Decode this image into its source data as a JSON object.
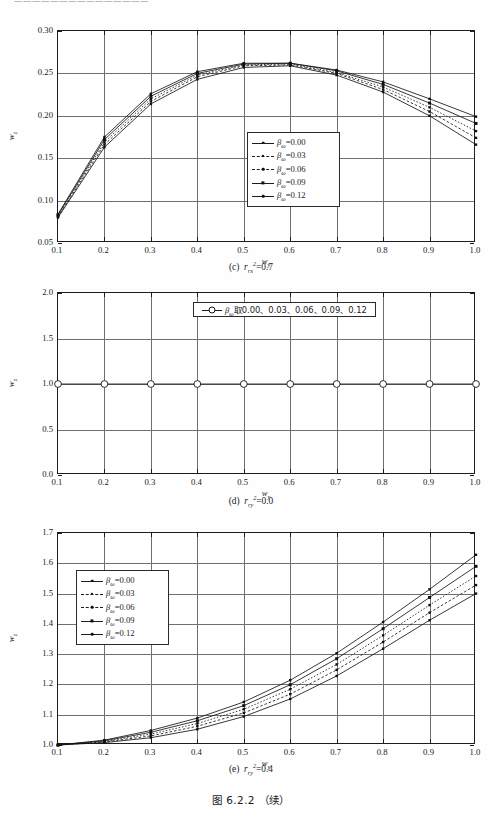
{
  "page": {
    "running_head": "———————————————",
    "figure_title": "图 6.2.2  （续）"
  },
  "figures": [
    {
      "id": "fig-c",
      "caption_label": "(c)",
      "caption_symbol": "r",
      "caption_sub": "rx",
      "caption_sup": "2",
      "caption_value": "=0.7",
      "xlabel": "w",
      "xlabel_sub": "y",
      "ylabel": "w",
      "ylabel_sub": "z"
    },
    {
      "id": "fig-d",
      "caption_label": "(d)",
      "caption_symbol": "r",
      "caption_sub": "ry",
      "caption_sup": "2",
      "caption_value": "=0.0",
      "xlabel": "w",
      "xlabel_sub": "y",
      "ylabel": "w",
      "ylabel_sub": "z",
      "inline_legend_symbol": "β",
      "inline_legend_sub": "ω",
      "inline_legend_text": "取0.00、0.03、0.06、0.09、0.12"
    },
    {
      "id": "fig-e",
      "caption_label": "(e)",
      "caption_symbol": "r",
      "caption_sub": "ry",
      "caption_sup": "2",
      "caption_value": "=0.4",
      "xlabel": "w",
      "xlabel_sub": "y",
      "ylabel": "w",
      "ylabel_sub": "z"
    }
  ],
  "legend_entries": [
    {
      "symbol": "β",
      "sub": "ω",
      "value": "=0.00",
      "marker": "mk-dot",
      "dash": false
    },
    {
      "symbol": "β",
      "sub": "ω",
      "value": "=0.03",
      "marker": "mk-sm",
      "dash": true
    },
    {
      "symbol": "β",
      "sub": "ω",
      "value": "=0.06",
      "marker": "mk-dot",
      "dash": true
    },
    {
      "symbol": "β",
      "sub": "ω",
      "value": "=0.09",
      "marker": "mk-sq",
      "dash": false
    },
    {
      "symbol": "β",
      "sub": "ω",
      "value": "=0.12",
      "marker": "mk-dot",
      "dash": false
    }
  ],
  "chart_data": [
    {
      "type": "line",
      "id": "fig-c",
      "title": "(c) r_rx^2 = 0.7",
      "xlabel": "w_y",
      "ylabel": "w_z",
      "xlim": [
        0.1,
        1.0
      ],
      "ylim": [
        0.05,
        0.3
      ],
      "xticks": [
        "0.1",
        "0.2",
        "0.3",
        "0.4",
        "0.5",
        "0.6",
        "0.7",
        "0.8",
        "0.9",
        "1.0"
      ],
      "yticks": [
        "0.05",
        "0.10",
        "0.15",
        "0.20",
        "0.25",
        "0.30"
      ],
      "grid": true,
      "legend_position": "center-right-inside",
      "x": [
        0.1,
        0.2,
        0.3,
        0.4,
        0.5,
        0.6,
        0.7,
        0.8,
        0.9,
        1.0
      ],
      "series": [
        {
          "name": "beta_w=0.00",
          "values": [
            0.08,
            0.163,
            0.214,
            0.243,
            0.257,
            0.259,
            0.248,
            0.228,
            0.2,
            0.166
          ]
        },
        {
          "name": "beta_w=0.03",
          "values": [
            0.081,
            0.166,
            0.217,
            0.246,
            0.259,
            0.26,
            0.25,
            0.231,
            0.205,
            0.174
          ]
        },
        {
          "name": "beta_w=0.06",
          "values": [
            0.082,
            0.169,
            0.22,
            0.248,
            0.26,
            0.261,
            0.251,
            0.234,
            0.21,
            0.182
          ]
        },
        {
          "name": "beta_w=0.09",
          "values": [
            0.083,
            0.172,
            0.223,
            0.25,
            0.261,
            0.262,
            0.253,
            0.237,
            0.215,
            0.191
          ]
        },
        {
          "name": "beta_w=0.12",
          "values": [
            0.084,
            0.175,
            0.226,
            0.252,
            0.262,
            0.262,
            0.254,
            0.24,
            0.22,
            0.199
          ]
        }
      ]
    },
    {
      "type": "line",
      "id": "fig-d",
      "title": "(d) r_ry^2 = 0.0",
      "xlabel": "w_y",
      "ylabel": "w_z",
      "xlim": [
        0.1,
        1.0
      ],
      "ylim": [
        0.0,
        2.0
      ],
      "xticks": [
        "0.1",
        "0.2",
        "0.3",
        "0.4",
        "0.5",
        "0.6",
        "0.7",
        "0.8",
        "0.9",
        "1.0"
      ],
      "yticks": [
        "0.0",
        "0.5",
        "1.0",
        "1.5",
        "2.0"
      ],
      "grid": true,
      "legend_position": "top-center-inside",
      "x": [
        0.1,
        0.2,
        0.3,
        0.4,
        0.5,
        0.6,
        0.7,
        0.8,
        0.9,
        1.0
      ],
      "series": [
        {
          "name": "beta_w=0.00,0.03,0.06,0.09,0.12",
          "values": [
            1.0,
            1.0,
            1.0,
            1.0,
            1.0,
            1.0,
            1.0,
            1.0,
            1.0,
            1.0
          ]
        }
      ]
    },
    {
      "type": "line",
      "id": "fig-e",
      "title": "(e) r_ry^2 = 0.4",
      "xlabel": "w_y",
      "ylabel": "w_z",
      "xlim": [
        0.1,
        1.0
      ],
      "ylim": [
        1.0,
        1.7
      ],
      "xticks": [
        "0.1",
        "0.2",
        "0.3",
        "0.4",
        "0.5",
        "0.6",
        "0.7",
        "0.8",
        "0.9",
        "1.0"
      ],
      "yticks": [
        "1.0",
        "1.1",
        "1.2",
        "1.3",
        "1.4",
        "1.5",
        "1.6",
        "1.7"
      ],
      "grid": true,
      "legend_position": "top-left-inside",
      "x": [
        0.1,
        0.2,
        0.3,
        0.4,
        0.5,
        0.6,
        0.7,
        0.8,
        0.9,
        1.0
      ],
      "series": [
        {
          "name": "beta_w=0.00",
          "values": [
            1.0,
            1.008,
            1.024,
            1.052,
            1.094,
            1.152,
            1.228,
            1.318,
            1.412,
            1.5
          ]
        },
        {
          "name": "beta_w=0.03",
          "values": [
            1.0,
            1.01,
            1.03,
            1.062,
            1.106,
            1.168,
            1.248,
            1.34,
            1.437,
            1.528
          ]
        },
        {
          "name": "beta_w=0.06",
          "values": [
            1.0,
            1.012,
            1.036,
            1.071,
            1.118,
            1.184,
            1.266,
            1.362,
            1.462,
            1.558
          ]
        },
        {
          "name": "beta_w=0.09",
          "values": [
            1.0,
            1.014,
            1.042,
            1.08,
            1.13,
            1.199,
            1.285,
            1.384,
            1.487,
            1.59
          ]
        },
        {
          "name": "beta_w=0.12",
          "values": [
            1.0,
            1.016,
            1.048,
            1.089,
            1.142,
            1.214,
            1.303,
            1.406,
            1.514,
            1.628
          ]
        }
      ]
    }
  ]
}
